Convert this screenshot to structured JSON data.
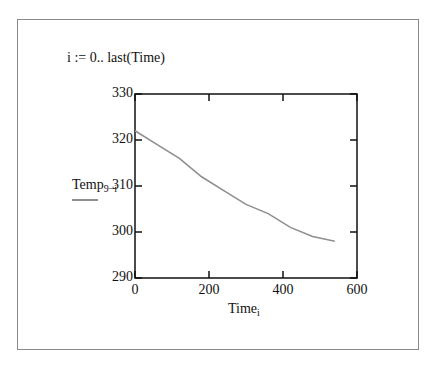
{
  "definition": "i := 0.. last(Time)",
  "chart_data": {
    "type": "line",
    "title": "",
    "xlabel": "Time",
    "xlabel_subscript": "i",
    "ylabel": "Temp",
    "ylabel_subscript": "9−i",
    "xlim": [
      0,
      600
    ],
    "ylim": [
      290,
      330
    ],
    "x_ticks": [
      "0",
      "200",
      "400",
      "600"
    ],
    "y_ticks": [
      "290",
      "300",
      "310",
      "320",
      "330"
    ],
    "grid": false,
    "legend_position": "left, under y-axis label",
    "series": [
      {
        "name": "Temp",
        "color": "#8f8f8f",
        "x": [
          0,
          60,
          120,
          180,
          240,
          300,
          360,
          420,
          480,
          540
        ],
        "y": [
          322,
          319,
          316,
          312,
          309,
          306,
          304,
          301,
          299,
          298
        ]
      }
    ]
  },
  "colors": {
    "axis": "#111111",
    "line": "#8f8f8f",
    "frame": "#8a8a8a"
  }
}
